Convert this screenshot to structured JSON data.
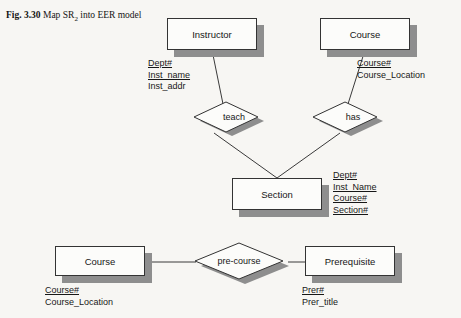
{
  "figure": {
    "number": "Fig. 3.30",
    "title_part1": "Map SR",
    "title_sub": "2",
    "title_part2": " into",
    "title_line2": "EER model"
  },
  "entities": {
    "instructor": {
      "name": "Instructor",
      "attributes": [
        {
          "label": "Dept#",
          "key": true
        },
        {
          "label": "Inst_name",
          "key": true
        },
        {
          "label": "Inst_addr",
          "key": false
        }
      ]
    },
    "course_top": {
      "name": "Course",
      "attributes": [
        {
          "label": "Course#",
          "key": true
        },
        {
          "label": "Course_Location",
          "key": false
        }
      ]
    },
    "section": {
      "name": "Section",
      "attributes": [
        {
          "label": "Dept#",
          "key": true
        },
        {
          "label": "Inst_Name",
          "key": true
        },
        {
          "label": "Course#",
          "key": true
        },
        {
          "label": "Section#",
          "key": true
        }
      ]
    },
    "course_bottom": {
      "name": "Course",
      "attributes": [
        {
          "label": "Course#",
          "key": true
        },
        {
          "label": "Course_Location",
          "key": false
        }
      ]
    },
    "prerequisite": {
      "name": "Prerequisite",
      "attributes": [
        {
          "label": "Prer#",
          "key": true
        },
        {
          "label": "Prer_title",
          "key": false
        }
      ]
    }
  },
  "relationships": {
    "teach": {
      "name": "teach"
    },
    "has": {
      "name": "has"
    },
    "pre_course": {
      "name": "pre-course"
    }
  },
  "colors": {
    "page_background": "#f7f6f3",
    "box_fill": "#fcfcfa",
    "box_stroke": "#333333",
    "shadow": "#8e8e8e",
    "line": "#3a3a3a",
    "text": "#161616"
  }
}
